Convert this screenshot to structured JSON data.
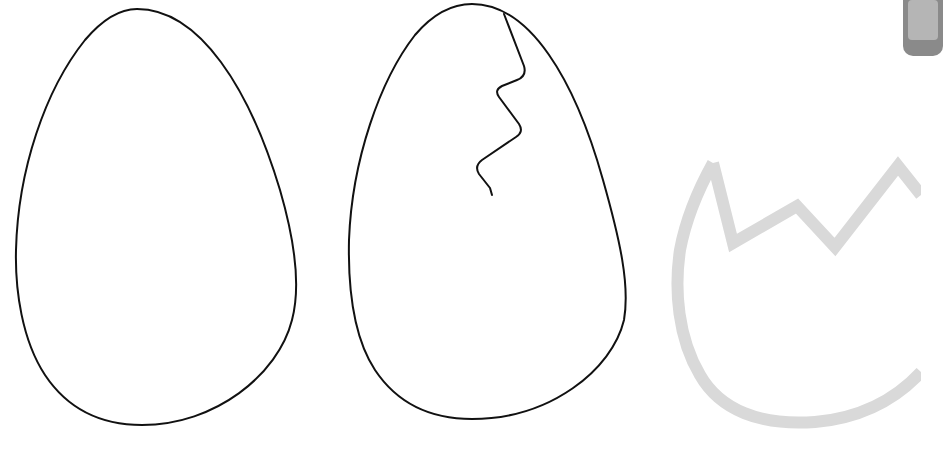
{
  "scene": {
    "description": "Three egg illustrations: a plain egg outline, a cracked egg outline, and a faded broken eggshell",
    "background": "#ffffff",
    "items": [
      {
        "id": "egg-plain",
        "label": "plain egg outline",
        "stroke": "#111111"
      },
      {
        "id": "egg-cracked",
        "label": "cracked egg outline",
        "stroke": "#111111"
      },
      {
        "id": "eggshell-broken",
        "label": "broken eggshell (faded)",
        "stroke": "#d6d6d6"
      }
    ],
    "corner_element": {
      "label": "partial gray tab",
      "color": "#8a8a8a"
    }
  }
}
